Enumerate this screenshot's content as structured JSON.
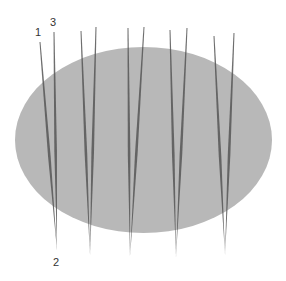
{
  "figure": {
    "background": "#ffffff",
    "ellipse": {
      "cx": 143.5,
      "cy": 140,
      "rx": 128.5,
      "ry": 93,
      "color": "#b8b8b8"
    },
    "needle_color": "#555555",
    "labels": [
      {
        "text": "1",
        "x": 35,
        "y": 36
      },
      {
        "text": "3",
        "x": 50,
        "y": 26
      },
      {
        "text": "2",
        "x": 53,
        "y": 266
      }
    ],
    "needle_pairs": [
      {
        "left_top": [
          40,
          42
        ],
        "right_top": [
          54,
          32
        ],
        "bottom": [
          57,
          250
        ]
      },
      {
        "left_top": [
          81,
          31
        ],
        "right_top": [
          96,
          27
        ],
        "bottom": [
          90,
          255
        ]
      },
      {
        "left_top": [
          128,
          28
        ],
        "right_top": [
          144,
          27
        ],
        "bottom": [
          130,
          257
        ]
      },
      {
        "left_top": [
          170,
          30
        ],
        "right_top": [
          187,
          28
        ],
        "bottom": [
          176,
          257
        ]
      },
      {
        "left_top": [
          214,
          36
        ],
        "right_top": [
          234,
          33
        ],
        "bottom": [
          225,
          255
        ]
      }
    ]
  }
}
